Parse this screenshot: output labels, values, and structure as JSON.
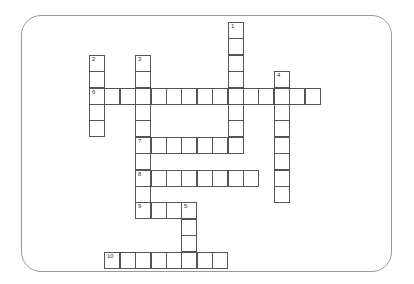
{
  "puzzle": {
    "type": "crossword",
    "grid": {
      "origin_x": 89,
      "origin_y": 22,
      "col_pitch": 15.4,
      "row_pitch": 16.4
    },
    "entries": [
      {
        "number": "1",
        "direction": "down",
        "col": 9,
        "row": 0,
        "length": 7
      },
      {
        "number": "2",
        "direction": "down",
        "col": 0,
        "row": 2,
        "length": 5
      },
      {
        "number": "3",
        "direction": "down",
        "col": 3,
        "row": 2,
        "length": 10
      },
      {
        "number": "4",
        "direction": "down",
        "col": 12,
        "row": 3,
        "length": 8
      },
      {
        "number": "5",
        "direction": "down",
        "col": 6,
        "row": 11,
        "length": 4
      },
      {
        "number": "6",
        "direction": "across",
        "col": 0,
        "row": 4,
        "length": 15
      },
      {
        "number": "7",
        "direction": "across",
        "col": 3,
        "row": 7,
        "length": 7
      },
      {
        "number": "8",
        "direction": "across",
        "col": 3,
        "row": 9,
        "length": 8
      },
      {
        "number": "9",
        "direction": "across",
        "col": 3,
        "row": 11,
        "length": 4
      },
      {
        "number": "10",
        "direction": "across",
        "col": 1,
        "row": 14,
        "length": 8
      }
    ]
  }
}
